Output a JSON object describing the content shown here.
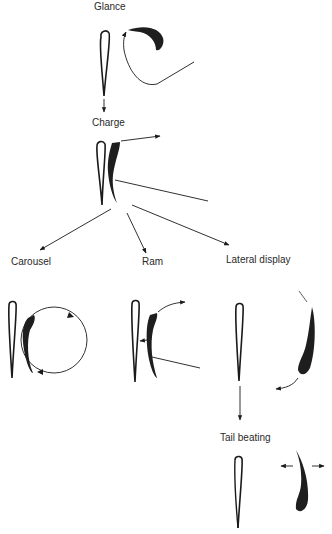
{
  "diagram": {
    "stages": {
      "glance": "Glance",
      "charge": "Charge",
      "carousel": "Carousel",
      "ram": "Ram",
      "lateral_display": "Lateral display",
      "tail_beating": "Tail beating"
    },
    "flow": [
      {
        "from": "Glance",
        "to": "Charge"
      },
      {
        "from": "Charge",
        "to": "Carousel"
      },
      {
        "from": "Charge",
        "to": "Ram"
      },
      {
        "from": "Charge",
        "to": "Lateral display"
      },
      {
        "from": "Lateral display",
        "to": "Tail beating"
      }
    ],
    "colors": {
      "ink": "#1a1a1a",
      "fish_fill": "#1e1e1e",
      "background": "#ffffff"
    }
  }
}
